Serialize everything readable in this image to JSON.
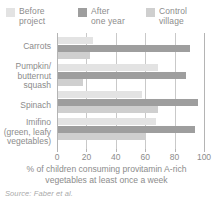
{
  "legend": {
    "items": [
      {
        "label_line1": "Before",
        "label_line2": "project",
        "color": "#e3e3e3",
        "name": "before-project"
      },
      {
        "label_line1": "After",
        "label_line2": "one year",
        "color": "#9e9e9e",
        "name": "after-one-year"
      },
      {
        "label_line1": "Control",
        "label_line2": "village",
        "color": "#cfcfcf",
        "name": "control-village"
      }
    ]
  },
  "axis": {
    "ticks": [
      "0",
      "20",
      "40",
      "60",
      "80",
      "100"
    ],
    "title_line1": "% of children consuming provitamin A-rich",
    "title_line2": "vegetables at least once a week"
  },
  "categories": [
    {
      "lines": [
        "Carrots"
      ]
    },
    {
      "lines": [
        "Pumpkin/",
        "butternut",
        "squash"
      ]
    },
    {
      "lines": [
        "Spinach"
      ]
    },
    {
      "lines": [
        "Imifino",
        "(green, leafy",
        "vegetables)"
      ]
    }
  ],
  "source": "Source: Faber et al.",
  "chart_data": {
    "type": "bar",
    "orientation": "horizontal",
    "title": "",
    "xlabel": "% of children consuming provitamin A-rich vegetables at least once a week",
    "ylabel": "",
    "xlim": [
      0,
      100
    ],
    "xticks": [
      0,
      20,
      40,
      60,
      80,
      100
    ],
    "grid": true,
    "legend_position": "top",
    "categories": [
      "Carrots",
      "Pumpkin/butternut squash",
      "Spinach",
      "Imifino (green, leafy vegetables)"
    ],
    "series": [
      {
        "name": "Before project",
        "color": "#e3e3e3",
        "values": [
          24,
          68,
          57,
          67
        ]
      },
      {
        "name": "After one year",
        "color": "#9e9e9e",
        "values": [
          90,
          87,
          95,
          93
        ]
      },
      {
        "name": "Control village",
        "color": "#cfcfcf",
        "values": [
          22,
          17,
          68,
          60
        ]
      }
    ]
  }
}
